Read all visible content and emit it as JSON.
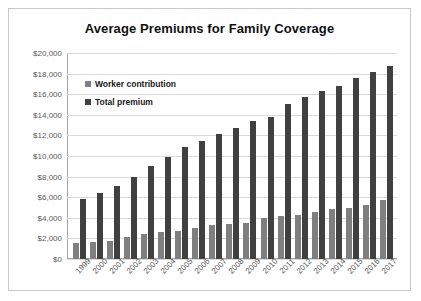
{
  "chart_data": {
    "type": "bar",
    "title": "Average Premiums for Family Coverage",
    "xlabel": "",
    "ylabel": "",
    "ylim": [
      0,
      20000
    ],
    "grid": true,
    "legend_position": "upper-left-inside",
    "categories": [
      "1999",
      "2000",
      "2001",
      "2002",
      "2003",
      "2004",
      "2005",
      "2006",
      "2007",
      "2008",
      "2009",
      "2010",
      "2011",
      "2012",
      "2013",
      "2014",
      "2015",
      "2016",
      "2017"
    ],
    "ytick_labels": [
      "$20,000",
      "$18,000",
      "$16,000",
      "$14,000",
      "$12,000",
      "$10,000",
      "$8,000",
      "$6,000",
      "$4,000",
      "$2,000",
      "$0"
    ],
    "ytick_values": [
      20000,
      18000,
      16000,
      14000,
      12000,
      10000,
      8000,
      6000,
      4000,
      2000,
      0
    ],
    "series": [
      {
        "name": "Worker contribution",
        "color": "#7f7f7f",
        "values": [
          1543,
          1619,
          1787,
          2137,
          2412,
          2661,
          2713,
          2973,
          3281,
          3354,
          3515,
          3997,
          4129,
          4316,
          4565,
          4823,
          4955,
          5277,
          5714
        ]
      },
      {
        "name": "Total premium",
        "color": "#404040",
        "values": [
          5791,
          6438,
          7061,
          8003,
          9068,
          9950,
          10880,
          11480,
          12106,
          12680,
          13375,
          13770,
          15073,
          15745,
          16351,
          16834,
          17545,
          18142,
          18764
        ]
      }
    ]
  },
  "legend": {
    "items": [
      {
        "label": "Worker contribution",
        "color": "#7f7f7f"
      },
      {
        "label": "Total premium",
        "color": "#404040"
      }
    ]
  }
}
